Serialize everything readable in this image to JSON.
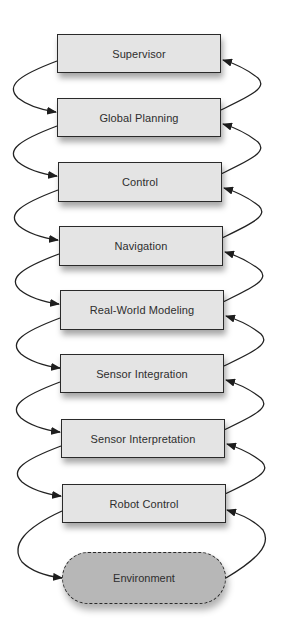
{
  "diagram": {
    "type": "layered-architecture",
    "layers": [
      {
        "label": "Supervisor"
      },
      {
        "label": "Global Planning"
      },
      {
        "label": "Control"
      },
      {
        "label": "Navigation"
      },
      {
        "label": "Real-World Modeling"
      },
      {
        "label": "Sensor Integration"
      },
      {
        "label": "Sensor Interpretation"
      },
      {
        "label": "Robot Control"
      }
    ],
    "environment": {
      "label": "Environment"
    },
    "connections": {
      "left_side": "downward arrows from each layer to the one below (down to Environment)",
      "right_side": "upward arrows from each layer (and Environment) to the one above"
    },
    "colors": {
      "box_fill": "#e4e4e4",
      "environment_fill": "#b7b7b7",
      "stroke": "#2a2a2a",
      "text": "#2e2e2e"
    }
  }
}
